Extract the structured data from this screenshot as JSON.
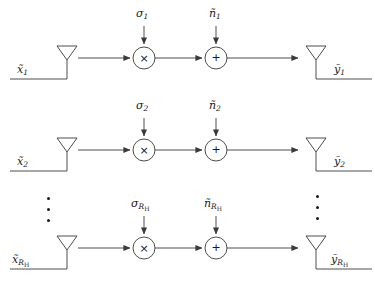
{
  "figure": {
    "type": "block-diagram",
    "rows": [
      {
        "id": "row-1",
        "input_label": "x",
        "input_sub": "1",
        "gain_label": "σ",
        "gain_sub": "1",
        "noise_label": "ñ",
        "noise_sub": "1",
        "output_label": "y",
        "output_sub": "1",
        "multiply_glyph": "×",
        "add_glyph": "+"
      },
      {
        "id": "row-2",
        "input_label": "x",
        "input_sub": "2",
        "gain_label": "σ",
        "gain_sub": "2",
        "noise_label": "ñ",
        "noise_sub": "2",
        "output_label": "y",
        "output_sub": "2",
        "multiply_glyph": "×",
        "add_glyph": "+"
      },
      {
        "id": "row-3",
        "input_label": "x",
        "input_sub": "R",
        "input_subsub": "H",
        "gain_label": "σ",
        "gain_sub": "R",
        "gain_subsub": "H",
        "noise_label": "ñ",
        "noise_sub": "R",
        "noise_subsub": "H",
        "output_label": "y",
        "output_sub": "R",
        "output_subsub": "H",
        "multiply_glyph": "×",
        "add_glyph": "+"
      }
    ],
    "ellipsis": {
      "left_dots": "⋮",
      "right_dots": "⋮"
    },
    "colors": {
      "stroke": "#3a3a3a",
      "text": "#1a1a1a",
      "background": "#ffffff"
    }
  }
}
